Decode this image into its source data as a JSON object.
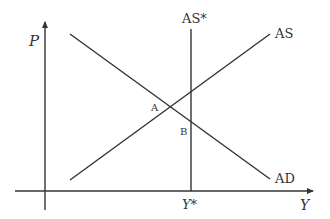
{
  "diagram": {
    "type": "AD-AS model",
    "axes": {
      "y_label": "P",
      "x_label": "Y",
      "x_tick_label": "Y*"
    },
    "curves": [
      {
        "id": "AD",
        "label": "AD",
        "description": "downward-sloping aggregate demand"
      },
      {
        "id": "AS",
        "label": "AS",
        "description": "upward-sloping short-run aggregate supply"
      },
      {
        "id": "AS_star",
        "label": "AS*",
        "description": "vertical long-run aggregate supply at Y*"
      }
    ],
    "points": [
      {
        "id": "A",
        "label": "A",
        "description": "intersection of AD and AS"
      },
      {
        "id": "B",
        "label": "B",
        "description": "intersection of AD and AS*"
      }
    ],
    "colors": {
      "line": "#333333",
      "background": "#ffffff"
    }
  }
}
